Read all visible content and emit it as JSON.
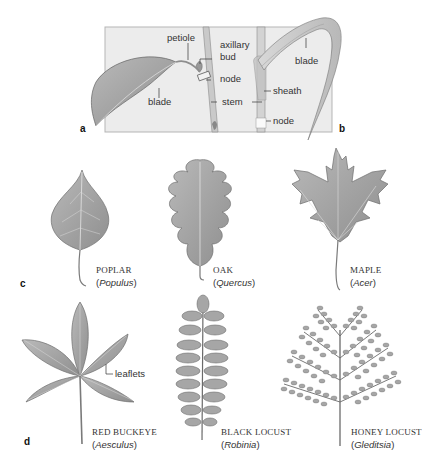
{
  "figure": {
    "panels": {
      "a": {
        "letter": "a",
        "labels": {
          "petiole": "petiole",
          "axillary_bud_line1": "axillary",
          "axillary_bud_line2": "bud",
          "node": "node",
          "blade": "blade",
          "stem": "stem"
        }
      },
      "b": {
        "letter": "b",
        "labels": {
          "blade": "blade",
          "sheath": "sheath",
          "node": "node"
        }
      },
      "c": {
        "letter": "c",
        "leaves": [
          {
            "common": "POPLAR",
            "genus": "Populus"
          },
          {
            "common": "OAK",
            "genus": "Quercus"
          },
          {
            "common": "MAPLE",
            "genus": "Acer"
          }
        ]
      },
      "d": {
        "letter": "d",
        "callout": "leaflets",
        "leaves": [
          {
            "common": "RED BUCKEYE",
            "genus": "Aesculus"
          },
          {
            "common": "BLACK LOCUST",
            "genus": "Robinia"
          },
          {
            "common": "HONEY LOCUST",
            "genus": "Gleditsia"
          }
        ]
      }
    },
    "colors": {
      "panel_bg": "#ebebeb",
      "panel_border": "#b5b5b5",
      "leaf_fill": "#a9a9a9",
      "leaf_dark": "#7e7e7e",
      "vein": "#e0e0e0",
      "text": "#333333"
    }
  }
}
